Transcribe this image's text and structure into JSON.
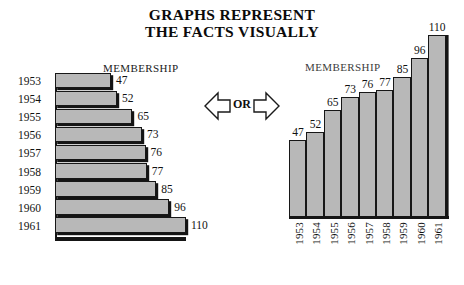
{
  "title": {
    "line1": "GRAPHS REPRESENT",
    "line2": "THE FACTS VISUALLY"
  },
  "connector": {
    "label": "OR",
    "left_arrow_icon": "arrow-left-icon",
    "right_arrow_icon": "arrow-right-icon"
  },
  "left_chart": {
    "caption": "MEMBERSHIP"
  },
  "right_chart": {
    "caption": "MEMBERSHIP"
  },
  "colors": {
    "bar_fill": "#b8b8b8",
    "bar_stroke": "#171717",
    "shadow": "#141414",
    "text": "#121212",
    "background": "#ffffff"
  },
  "chart_data": [
    {
      "type": "bar",
      "orientation": "horizontal",
      "title": "MEMBERSHIP",
      "xlabel": "",
      "ylabel": "",
      "categories": [
        "1953",
        "1954",
        "1955",
        "1956",
        "1957",
        "1958",
        "1959",
        "1960",
        "1961"
      ],
      "values": [
        47,
        52,
        65,
        73,
        76,
        77,
        85,
        96,
        110
      ],
      "data_labels": [
        "47",
        "52",
        "65",
        "73",
        "76",
        "77",
        "85",
        "96",
        "110"
      ],
      "xlim": [
        0,
        110
      ],
      "grid": false,
      "legend": null
    },
    {
      "type": "bar",
      "orientation": "vertical",
      "title": "MEMBERSHIP",
      "xlabel": "",
      "ylabel": "",
      "categories": [
        "1953",
        "1954",
        "1955",
        "1956",
        "1957",
        "1958",
        "1959",
        "1960",
        "1961"
      ],
      "values": [
        47,
        52,
        65,
        73,
        76,
        77,
        85,
        96,
        110
      ],
      "data_labels": [
        "47",
        "52",
        "65",
        "73",
        "76",
        "77",
        "85",
        "96",
        "110"
      ],
      "ylim": [
        0,
        110
      ],
      "grid": false,
      "legend": null
    }
  ]
}
